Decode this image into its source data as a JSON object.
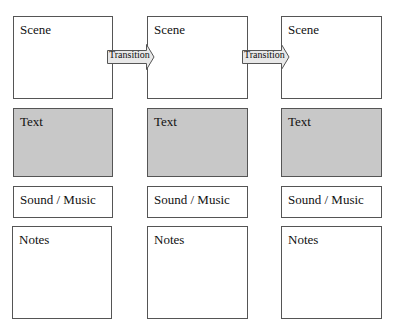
{
  "storyboard": {
    "columns": [
      {
        "scene_label": "Scene",
        "text_label": "Text",
        "sound_label": "Sound / Music",
        "notes_label": "Notes"
      },
      {
        "scene_label": "Scene",
        "text_label": "Text",
        "sound_label": "Sound / Music",
        "notes_label": "Notes"
      },
      {
        "scene_label": "Scene",
        "text_label": "Text",
        "sound_label": "Sound / Music",
        "notes_label": "Notes"
      }
    ],
    "transitions": [
      {
        "label": "Transition"
      },
      {
        "label": "Transition"
      }
    ],
    "colors": {
      "border": "#555555",
      "text_panel_fill": "#c8c8c8",
      "arrow_fill": "#e8e8e8"
    }
  }
}
